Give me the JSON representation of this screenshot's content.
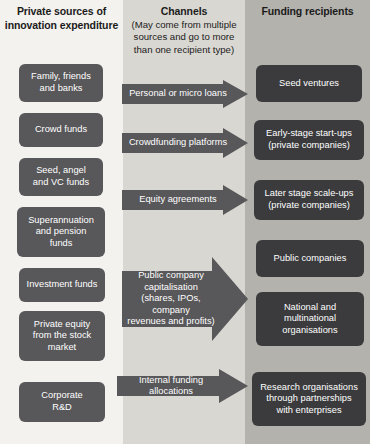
{
  "columns": {
    "sources": {
      "title": "Private sources of\ninnovation expenditure",
      "title_line1": "Private sources of",
      "title_line2": "innovation expenditure",
      "bg_color": "#f4f2ee",
      "node_color": "#58575a"
    },
    "channels": {
      "title": "Channels",
      "subtitle": "(May come from multiple sources and go to more than one recipient type)",
      "subtitle_line1": "(May come from multiple",
      "subtitle_line2": "sources and go to more",
      "subtitle_line3": "than one recipient type)",
      "bg_color": "#d9d7d2",
      "arrow_color": "#58575a"
    },
    "recipients": {
      "title": "Funding recipients",
      "bg_color": "#b4b2ad",
      "node_color": "#3b3b3d"
    }
  },
  "sources": [
    {
      "label": "Family, friends and banks",
      "lines": [
        "Family, friends",
        "and banks"
      ]
    },
    {
      "label": "Crowd funds",
      "lines": [
        "Crowd funds"
      ]
    },
    {
      "label": "Seed, angel and VC funds",
      "lines": [
        "Seed, angel",
        "and VC funds"
      ]
    },
    {
      "label": "Superannuation and pension funds",
      "lines": [
        "Superannuation",
        "and pension",
        "funds"
      ]
    },
    {
      "label": "Investment funds",
      "lines": [
        "Investment funds"
      ]
    },
    {
      "label": "Private equity from the stock market",
      "lines": [
        "Private equity",
        "from the stock",
        "market"
      ]
    },
    {
      "label": "Corporate R&D",
      "lines": [
        "Corporate",
        "R&D"
      ]
    }
  ],
  "channels": [
    {
      "label": "Personal or micro loans",
      "lines": [
        "Personal or micro loans"
      ]
    },
    {
      "label": "Crowdfunding platforms",
      "lines": [
        "Crowdfunding platforms"
      ]
    },
    {
      "label": "Equity agreements",
      "lines": [
        "Equity agreements"
      ]
    },
    {
      "label": "Public company capitalisation (shares, IPOs, company revenues and profits)",
      "lines": [
        "Public company",
        "capitalisation",
        "(shares, IPOs, company",
        "revenues and profits)"
      ]
    },
    {
      "label": "Internal funding allocations",
      "lines": [
        "Internal funding allocations"
      ]
    }
  ],
  "recipients": [
    {
      "label": "Seed ventures",
      "lines": [
        "Seed ventures"
      ]
    },
    {
      "label": "Early-stage start-ups (private companies)",
      "lines": [
        "Early-stage start-ups",
        "(private companies)"
      ]
    },
    {
      "label": "Later stage scale-ups (private companies)",
      "lines": [
        "Later stage scale-ups",
        "(private companies)"
      ]
    },
    {
      "label": "Public companies",
      "lines": [
        "Public companies"
      ]
    },
    {
      "label": "National and multinational organisations",
      "lines": [
        "National and",
        "multinational",
        "organisations"
      ]
    },
    {
      "label": "Research organisations through partnerships with enterprises",
      "lines": [
        "Research organisations",
        "through partnerships",
        "with enterprises"
      ]
    }
  ]
}
